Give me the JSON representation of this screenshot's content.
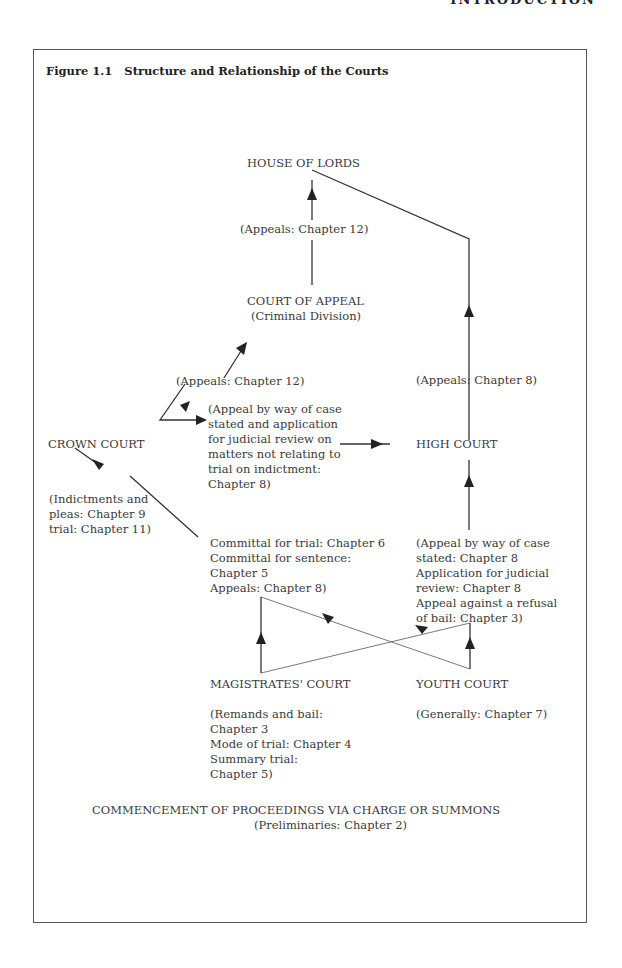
{
  "page": {
    "running_head": "INTRODUCTION"
  },
  "figure": {
    "title": "Figure 1.1   Structure and Relationship of the Courts",
    "nodes": {
      "house_of_lords": "HOUSE OF LORDS",
      "appeals_ch12_top": "(Appeals: Chapter 12)",
      "court_of_appeal": "COURT OF APPEAL",
      "criminal_division": "(Criminal Division)",
      "appeals_ch12_left": "(Appeals: Chapter 12)",
      "appeals_ch8_right": "(Appeals: Chapter 8)",
      "crown_court": "CROWN COURT",
      "case_stated_note": "(Appeal by way of case\nstated and application\nfor judicial review on\nmatters not relating to\ntrial on indictment:\nChapter 8)",
      "high_court": "HIGH COURT",
      "indictments_note": "(Indictments and\npleas: Chapter 9\ntrial: Chapter 11)",
      "committal_note": "Committal for trial: Chapter 6\nCommittal for sentence:\nChapter 5\nAppeals: Chapter 8)",
      "high_court_appeal_note": "(Appeal by way of case\nstated: Chapter 8\nApplication for judicial\nreview: Chapter 8\nAppeal against a refusal\nof bail: Chapter 3)",
      "magistrates_court": "MAGISTRATES' COURT",
      "youth_court": "YOUTH COURT",
      "magistrates_note": "(Remands and bail:\nChapter 3\nMode of trial: Chapter 4\nSummary trial:\nChapter 5)",
      "youth_note": "(Generally: Chapter 7)",
      "commencement": "COMMENCEMENT OF PROCEEDINGS VIA CHARGE OR SUMMONS",
      "preliminaries": "(Preliminaries: Chapter 2)"
    }
  }
}
